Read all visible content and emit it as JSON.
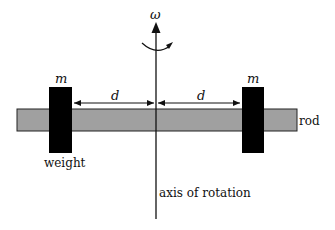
{
  "diagram": {
    "type": "physics-rotating-rod",
    "labels": {
      "omega": "ω",
      "mass_left": "m",
      "mass_right": "m",
      "distance_left": "d",
      "distance_right": "d",
      "rod": "rod",
      "weight": "weight",
      "axis": "axis of rotation"
    },
    "colors": {
      "rod_fill": "#a0a0a0",
      "rod_stroke": "#222222",
      "weight_fill": "#000000",
      "line": "#111111",
      "background": "#ffffff"
    },
    "icons": {
      "rotation": "curved-rotation-arrow-icon",
      "axis_arrow": "arrow-up-icon"
    }
  }
}
